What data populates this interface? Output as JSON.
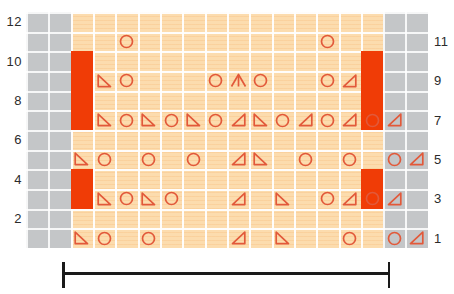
{
  "chart_data": {
    "type": "table",
    "title": "",
    "kind": "knitting-stitch-chart",
    "columns": 18,
    "rows": 12,
    "cell_width": 22.33,
    "cell_height": 19.66,
    "colors": {
      "grid_background": "#fcdcae",
      "gridline": "#ffffff",
      "no_stitch_block": "#c4c6c8",
      "symbol_stroke": "#e2593a",
      "marker_bar": "#f03c06",
      "label_text": "#2b2b2b",
      "bracket": "#1a1a1a"
    },
    "row_labels_left": [
      "12",
      "10",
      "8",
      "6",
      "4",
      "2"
    ],
    "row_labels_right": [
      "11",
      "9",
      "7",
      "5",
      "3",
      "1"
    ],
    "legend_note": "",
    "symbols": {
      "circle": "yarn-over",
      "left-triangle": "decrease-left",
      "right-triangle": "decrease-right",
      "peak": "central-double-decrease"
    },
    "grey_blocks": [
      {
        "side": "left",
        "columns": 2
      },
      {
        "side": "right",
        "columns": 2
      }
    ],
    "marker_bars": [
      {
        "col": 2,
        "row_from": 10,
        "row_to": 7
      },
      {
        "col": 15,
        "row_from": 10,
        "row_to": 7
      },
      {
        "col": 2,
        "row_from": 4,
        "row_to": 3
      },
      {
        "col": 15,
        "row_from": 4,
        "row_to": 3
      }
    ],
    "cells": [
      {
        "row": 11,
        "col": 4,
        "symbol": "circle"
      },
      {
        "row": 11,
        "col": 13,
        "symbol": "circle"
      },
      {
        "row": 9,
        "col": 3,
        "symbol": "left-triangle"
      },
      {
        "row": 9,
        "col": 4,
        "symbol": "circle"
      },
      {
        "row": 9,
        "col": 8,
        "symbol": "circle"
      },
      {
        "row": 9,
        "col": 9,
        "symbol": "peak"
      },
      {
        "row": 9,
        "col": 10,
        "symbol": "circle"
      },
      {
        "row": 9,
        "col": 13,
        "symbol": "circle"
      },
      {
        "row": 9,
        "col": 14,
        "symbol": "right-triangle"
      },
      {
        "row": 7,
        "col": 3,
        "symbol": "left-triangle"
      },
      {
        "row": 7,
        "col": 4,
        "symbol": "circle"
      },
      {
        "row": 7,
        "col": 5,
        "symbol": "left-triangle"
      },
      {
        "row": 7,
        "col": 6,
        "symbol": "circle"
      },
      {
        "row": 7,
        "col": 7,
        "symbol": "left-triangle"
      },
      {
        "row": 7,
        "col": 8,
        "symbol": "circle"
      },
      {
        "row": 7,
        "col": 9,
        "symbol": "right-triangle"
      },
      {
        "row": 7,
        "col": 10,
        "symbol": "left-triangle"
      },
      {
        "row": 7,
        "col": 11,
        "symbol": "circle"
      },
      {
        "row": 7,
        "col": 12,
        "symbol": "right-triangle"
      },
      {
        "row": 7,
        "col": 13,
        "symbol": "circle"
      },
      {
        "row": 7,
        "col": 14,
        "symbol": "right-triangle"
      },
      {
        "row": 7,
        "col": 15,
        "symbol": "circle"
      },
      {
        "row": 7,
        "col": 16,
        "symbol": "right-triangle"
      },
      {
        "row": 5,
        "col": 2,
        "symbol": "left-triangle"
      },
      {
        "row": 5,
        "col": 3,
        "symbol": "circle"
      },
      {
        "row": 5,
        "col": 5,
        "symbol": "circle"
      },
      {
        "row": 5,
        "col": 7,
        "symbol": "circle"
      },
      {
        "row": 5,
        "col": 9,
        "symbol": "right-triangle"
      },
      {
        "row": 5,
        "col": 10,
        "symbol": "left-triangle"
      },
      {
        "row": 5,
        "col": 12,
        "symbol": "circle"
      },
      {
        "row": 5,
        "col": 14,
        "symbol": "circle"
      },
      {
        "row": 5,
        "col": 16,
        "symbol": "circle"
      },
      {
        "row": 5,
        "col": 17,
        "symbol": "right-triangle"
      },
      {
        "row": 3,
        "col": 3,
        "symbol": "left-triangle"
      },
      {
        "row": 3,
        "col": 4,
        "symbol": "circle"
      },
      {
        "row": 3,
        "col": 5,
        "symbol": "left-triangle"
      },
      {
        "row": 3,
        "col": 6,
        "symbol": "circle"
      },
      {
        "row": 3,
        "col": 9,
        "symbol": "right-triangle"
      },
      {
        "row": 3,
        "col": 11,
        "symbol": "left-triangle"
      },
      {
        "row": 3,
        "col": 13,
        "symbol": "circle"
      },
      {
        "row": 3,
        "col": 14,
        "symbol": "right-triangle"
      },
      {
        "row": 3,
        "col": 15,
        "symbol": "circle"
      },
      {
        "row": 3,
        "col": 16,
        "symbol": "right-triangle"
      },
      {
        "row": 1,
        "col": 2,
        "symbol": "left-triangle"
      },
      {
        "row": 1,
        "col": 3,
        "symbol": "circle"
      },
      {
        "row": 1,
        "col": 5,
        "symbol": "circle"
      },
      {
        "row": 1,
        "col": 9,
        "symbol": "right-triangle"
      },
      {
        "row": 1,
        "col": 11,
        "symbol": "left-triangle"
      },
      {
        "row": 1,
        "col": 14,
        "symbol": "circle"
      },
      {
        "row": 1,
        "col": 16,
        "symbol": "circle"
      },
      {
        "row": 1,
        "col": 17,
        "symbol": "right-triangle"
      }
    ]
  },
  "repeat_bracket": {
    "label": "",
    "left_px": 62,
    "right_px": 390
  }
}
